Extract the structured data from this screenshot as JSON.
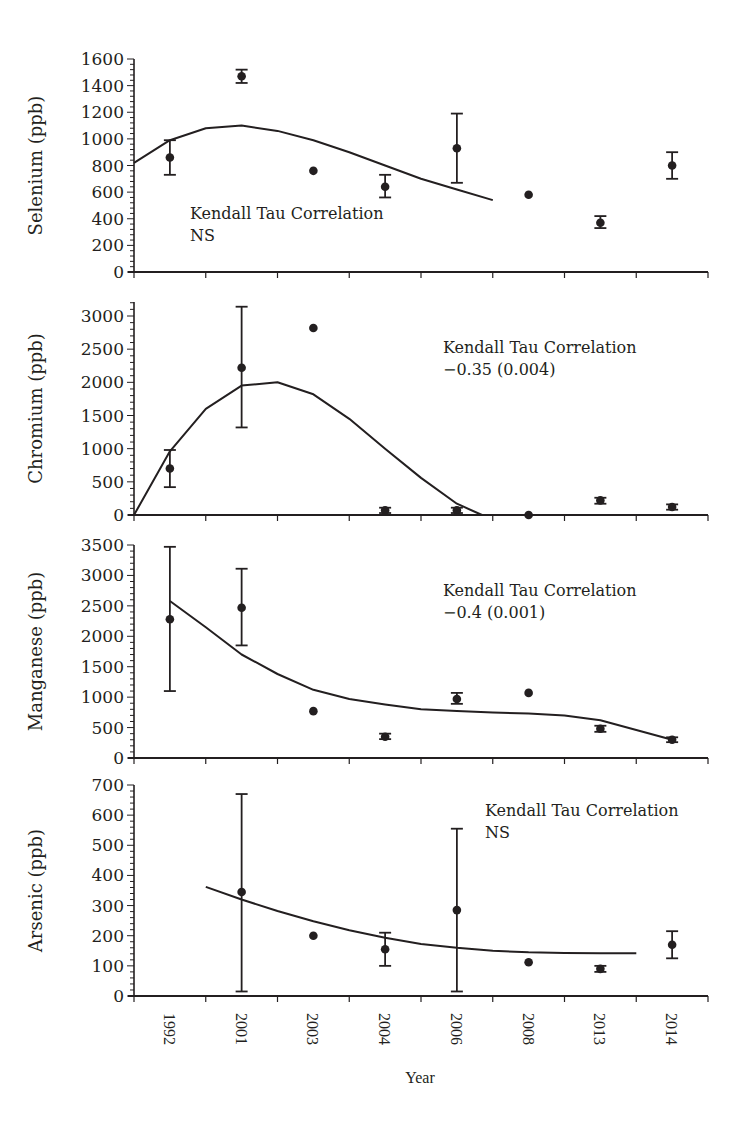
{
  "figure": {
    "xlabel": "Year",
    "categories": [
      "1992",
      "2001",
      "2003",
      "2004",
      "2006",
      "2008",
      "2013",
      "2014"
    ]
  },
  "chart_data": [
    {
      "type": "scatter",
      "title": "",
      "xlabel": "Year",
      "ylabel": "Selenium (ppb)",
      "ylim": [
        0,
        1600
      ],
      "yticks": [
        0,
        200,
        400,
        600,
        800,
        1000,
        1200,
        1400,
        1600
      ],
      "categories": [
        "1992",
        "2001",
        "2003",
        "2004",
        "2006",
        "2008",
        "2013",
        "2014"
      ],
      "values": [
        860,
        1470,
        760,
        640,
        930,
        580,
        370,
        800
      ],
      "error_low": [
        730,
        1420,
        null,
        560,
        670,
        null,
        330,
        700
      ],
      "error_high": [
        990,
        1520,
        null,
        730,
        1190,
        null,
        420,
        900
      ],
      "trend_line": {
        "x": [
          0.0,
          0.5,
          1.0,
          1.5,
          2.0,
          2.5,
          3.0,
          3.5,
          4.0,
          4.5,
          5.0
        ],
        "y": [
          820,
          990,
          1080,
          1100,
          1060,
          990,
          900,
          800,
          700,
          620,
          540
        ]
      },
      "annotation": [
        "Kendall Tau Correlation",
        "NS"
      ]
    },
    {
      "type": "scatter",
      "title": "",
      "xlabel": "Year",
      "ylabel": "Chromium (ppb)",
      "ylim": [
        0,
        3200
      ],
      "yticks": [
        0,
        500,
        1000,
        1500,
        2000,
        2500,
        3000
      ],
      "categories": [
        "1992",
        "2001",
        "2003",
        "2004",
        "2006",
        "2008",
        "2013",
        "2014"
      ],
      "values": [
        700,
        2220,
        2820,
        70,
        70,
        0,
        220,
        120
      ],
      "error_low": [
        420,
        1320,
        null,
        30,
        30,
        null,
        170,
        80
      ],
      "error_high": [
        980,
        3140,
        null,
        110,
        110,
        null,
        260,
        160
      ],
      "trend_line": {
        "x": [
          0.0,
          0.5,
          1.0,
          1.5,
          2.0,
          2.5,
          3.0,
          3.5,
          4.0,
          4.5,
          4.85
        ],
        "y": [
          0,
          960,
          1600,
          1950,
          2000,
          1820,
          1450,
          1000,
          560,
          170,
          0
        ]
      },
      "annotation": [
        "Kendall Tau Correlation",
        "−0.35 (0.004)"
      ]
    },
    {
      "type": "scatter",
      "title": "",
      "xlabel": "Year",
      "ylabel": "Manganese (ppb)",
      "ylim": [
        0,
        3500
      ],
      "yticks": [
        0,
        500,
        1000,
        1500,
        2000,
        2500,
        3000,
        3500
      ],
      "categories": [
        "1992",
        "2001",
        "2003",
        "2004",
        "2006",
        "2008",
        "2013",
        "2014"
      ],
      "values": [
        2280,
        2470,
        770,
        350,
        970,
        1070,
        480,
        300
      ],
      "error_low": [
        1100,
        1850,
        null,
        310,
        890,
        null,
        430,
        260
      ],
      "error_high": [
        3470,
        3110,
        null,
        400,
        1070,
        null,
        530,
        340
      ],
      "trend_line": {
        "x": [
          0.5,
          1.0,
          1.5,
          2.0,
          2.5,
          3.0,
          3.5,
          4.0,
          4.5,
          5.0,
          5.5,
          6.0,
          6.5,
          7.0,
          7.5
        ],
        "y": [
          2580,
          2150,
          1700,
          1380,
          1120,
          970,
          880,
          800,
          770,
          750,
          730,
          700,
          620,
          460,
          300
        ]
      },
      "annotation": [
        "Kendall Tau Correlation",
        "−0.4 (0.001)"
      ]
    },
    {
      "type": "scatter",
      "title": "",
      "xlabel": "Year",
      "ylabel": "Arsenic (ppb)",
      "ylim": [
        0,
        700
      ],
      "yticks": [
        0,
        100,
        200,
        300,
        400,
        500,
        600,
        700
      ],
      "categories": [
        "1992",
        "2001",
        "2003",
        "2004",
        "2006",
        "2008",
        "2013",
        "2014"
      ],
      "values": [
        null,
        345,
        200,
        155,
        285,
        112,
        90,
        170
      ],
      "error_low": [
        null,
        15,
        null,
        100,
        15,
        null,
        80,
        125
      ],
      "error_high": [
        null,
        670,
        null,
        210,
        555,
        null,
        100,
        215
      ],
      "trend_line": {
        "x": [
          1.0,
          1.5,
          2.0,
          2.5,
          3.0,
          3.5,
          4.0,
          4.5,
          5.0,
          5.5,
          6.0,
          6.5,
          7.0
        ],
        "y": [
          362,
          320,
          282,
          248,
          218,
          193,
          173,
          160,
          150,
          145,
          143,
          142,
          142
        ]
      },
      "annotation": [
        "Kendall Tau Correlation",
        "NS"
      ]
    }
  ]
}
